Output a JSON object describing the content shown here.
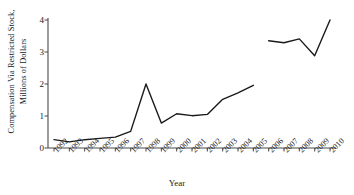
{
  "chart_data": {
    "type": "line",
    "title": "",
    "subtitle": "",
    "xlabel": "Year",
    "ylabel": "Compensation Via Restricted Stock, Millions of Dollars",
    "ylabel_lines": [
      "Compensation Via Restricted Stock,",
      "Millions of Dollars"
    ],
    "categories": [
      "1992",
      "1993",
      "1994",
      "1995",
      "1996",
      "1997",
      "1998",
      "1999",
      "2000",
      "2001",
      "2002",
      "2003",
      "2004",
      "2005",
      "2006",
      "2007",
      "2008",
      "2009",
      "2010"
    ],
    "xtick_labels": [
      "1992",
      "1993",
      "1994",
      "1995",
      "1996",
      "1997",
      "1998",
      "1999",
      "2000",
      "2001",
      "2002",
      "2003",
      "2004",
      "2005",
      "2006",
      "2007",
      "2008",
      "2009",
      "2010"
    ],
    "ytick_labels": [
      "0",
      "1",
      "2",
      "3",
      "4"
    ],
    "ytick_values": [
      0,
      1,
      2,
      3,
      4
    ],
    "ylim": [
      0,
      4
    ],
    "xlim_years": [
      1992,
      2010
    ],
    "grid": false,
    "legend": false,
    "legend_position": "none",
    "line_color": "#1a1a1a",
    "line_width": 1.4,
    "markers": false,
    "series": [
      {
        "name": "Restricted stock compensation (1992-2005)",
        "x": [
          "1992",
          "1993",
          "1994",
          "1995",
          "1996",
          "1997",
          "1998",
          "1999",
          "2000",
          "2001",
          "2002",
          "2003",
          "2004",
          "2005"
        ],
        "values": [
          0.26,
          0.19,
          0.26,
          0.3,
          0.34,
          0.52,
          2.0,
          0.78,
          1.07,
          1.01,
          1.05,
          1.52,
          1.72,
          1.96
        ]
      },
      {
        "name": "Restricted stock compensation (2006-2010)",
        "x": [
          "2006",
          "2007",
          "2008",
          "2009",
          "2010"
        ],
        "values": [
          3.35,
          3.29,
          3.41,
          2.88,
          4.0
        ]
      }
    ],
    "break_note": "Series is discontinuous between 2005 and 2006"
  },
  "axis": {
    "y_title_line1": "Compensation Via Restricted Stock,",
    "y_title_line2": "Millions of Dollars",
    "x_title": "Year"
  }
}
